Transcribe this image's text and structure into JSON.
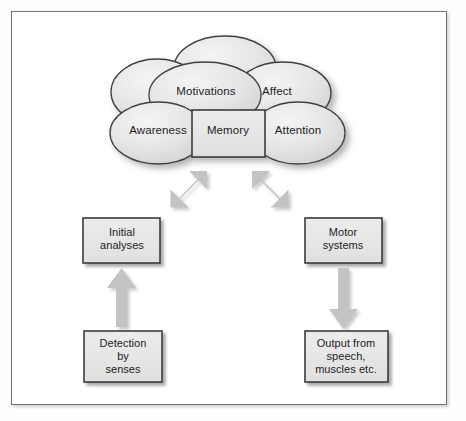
{
  "figure": {
    "colors": {
      "box_fill": "#e8e8e8",
      "box_border": "#3b3b3b",
      "cloud_fill": "#e2e2e2",
      "cloud_border": "#3f3f3f",
      "arrow_fill": "#c3c3c3",
      "frame_border": "#6f7277",
      "text": "#1d1d1d",
      "background": "#ffffff"
    }
  },
  "cloud_cluster": {
    "name": "mind-cloud-cluster",
    "unlabeled_clouds": 2,
    "nodes": [
      {
        "id": "motivations",
        "label": "Motivations",
        "shape": "cloud"
      },
      {
        "id": "affect",
        "label": "Affect",
        "shape": "cloud"
      },
      {
        "id": "awareness",
        "label": "Awareness",
        "shape": "cloud"
      },
      {
        "id": "attention",
        "label": "Attention",
        "shape": "cloud"
      },
      {
        "id": "memory",
        "label": "Memory",
        "shape": "rectangle"
      }
    ]
  },
  "input_chain": {
    "name": "sensory-input-chain",
    "boxes": [
      {
        "id": "initial-analyses",
        "label": "Initial\nanalyses"
      },
      {
        "id": "detection-by-senses",
        "label": "Detection\nby\nsenses"
      }
    ],
    "arrow": {
      "id": "detection-to-initial-arrow",
      "direction": "up",
      "heads": 1
    }
  },
  "output_chain": {
    "name": "motor-output-chain",
    "boxes": [
      {
        "id": "motor-systems",
        "label": "Motor\nsystems"
      },
      {
        "id": "output-speech-muscles",
        "label": "Output from\nspeech,\nmuscles etc."
      }
    ],
    "arrow": {
      "id": "motor-to-output-arrow",
      "direction": "down",
      "heads": 1
    }
  },
  "connectors": [
    {
      "id": "cloud-to-initial-analyses-arrow",
      "label": "",
      "direction": "diagonal-ne-sw",
      "heads": 2,
      "from": "initial-analyses",
      "to": "mind-cloud-cluster"
    },
    {
      "id": "cloud-to-motor-systems-arrow",
      "label": "",
      "direction": "diagonal-nw-se",
      "heads": 2,
      "from": "mind-cloud-cluster",
      "to": "motor-systems"
    }
  ]
}
